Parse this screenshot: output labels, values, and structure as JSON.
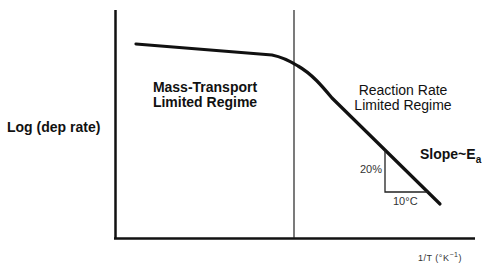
{
  "diagram": {
    "type": "arrhenius-deposition-rate-plot",
    "y_axis_label": "Log (dep  rate)",
    "x_axis_label": "1/T (°K",
    "x_axis_label_sup": "−1",
    "x_axis_label_close": ")",
    "regions": [
      {
        "line1": "Mass-Transport",
        "line2": "Limited Regime"
      },
      {
        "line1": "Reaction Rate",
        "line2": "Limited Regime"
      }
    ],
    "slope_label": "Slope~E",
    "slope_label_sub": "a",
    "triangle": {
      "vertical_label": "20%",
      "horizontal_label": "10°C"
    },
    "colors": {
      "line": "#111111",
      "background": "#ffffff"
    }
  }
}
